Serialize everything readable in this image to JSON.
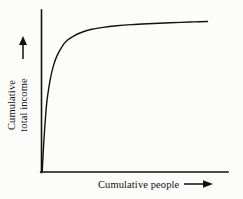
{
  "figure": {
    "background_color": "#fcfcfb",
    "ink_color": "#111111",
    "width": 243,
    "height": 199
  },
  "axes": {
    "y_axis": {
      "label_line_1": "Cumulative",
      "label_line_2": "total income",
      "arrow_icon": "arrow-up-icon",
      "arrow_direction": "up",
      "orientation": "vertical",
      "has_ticks": false,
      "has_tick_labels": false
    },
    "x_axis": {
      "label": "Cumulative people",
      "arrow_icon": "arrow-right-icon",
      "arrow_direction": "right",
      "orientation": "horizontal",
      "has_ticks": false,
      "has_tick_labels": false
    }
  },
  "chart_data": {
    "type": "line",
    "title": "",
    "subtitle": "",
    "xlabel": "Cumulative people",
    "ylabel": "Cumulative total income",
    "grid": false,
    "legend": null,
    "legend_position": "none",
    "xlim": [
      0,
      1
    ],
    "ylim": [
      0,
      1
    ],
    "xticks": [],
    "yticks": [],
    "xticklabels": [],
    "yticklabels": [],
    "annotations": [],
    "series": [
      {
        "name": "Cumulative total income",
        "color": "#111111",
        "line_width": 1.4,
        "x": [
          0.0,
          0.01,
          0.02,
          0.03,
          0.05,
          0.07,
          0.09,
          0.12,
          0.15,
          0.19,
          0.24,
          0.3,
          0.37,
          0.45,
          0.54,
          0.64,
          0.74,
          0.84,
          0.92,
          1.0
        ],
        "y": [
          0.0,
          0.2,
          0.36,
          0.48,
          0.62,
          0.71,
          0.77,
          0.83,
          0.87,
          0.9,
          0.925,
          0.945,
          0.958,
          0.968,
          0.976,
          0.982,
          0.987,
          0.991,
          0.994,
          0.997
        ]
      }
    ]
  }
}
